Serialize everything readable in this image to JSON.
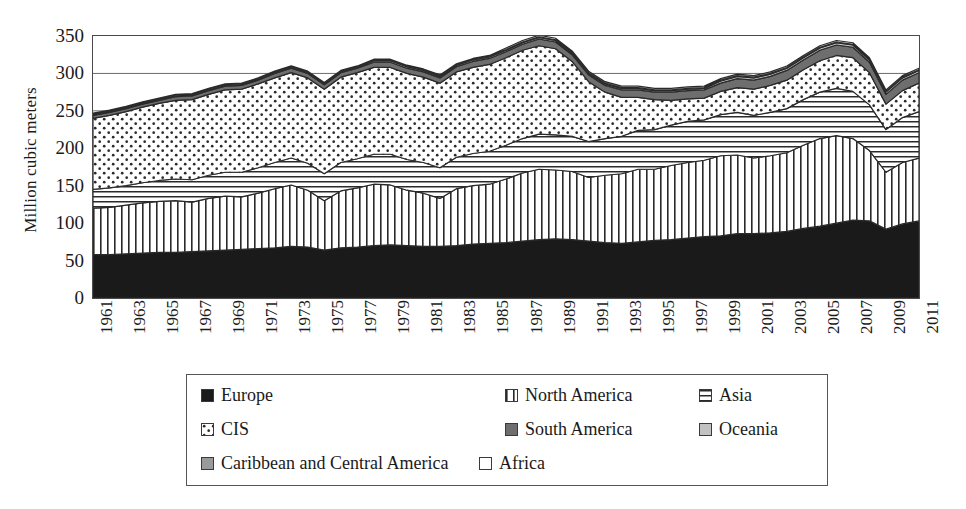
{
  "chart_data": {
    "type": "area",
    "title": "",
    "subtitle": "",
    "xlabel": "",
    "ylabel": "Million cubic meters",
    "stacked": true,
    "grid": true,
    "legend_position": "bottom",
    "ylim": [
      0,
      350
    ],
    "ytick_values": [
      0,
      50,
      100,
      150,
      200,
      250,
      300,
      350
    ],
    "ytick_labels": [
      "0",
      "50",
      "100",
      "150",
      "200",
      "250",
      "300",
      "350"
    ],
    "xlim": [
      1961,
      2011
    ],
    "x": [
      1961,
      1962,
      1963,
      1964,
      1965,
      1966,
      1967,
      1968,
      1969,
      1970,
      1971,
      1972,
      1973,
      1974,
      1975,
      1976,
      1977,
      1978,
      1979,
      1980,
      1981,
      1982,
      1983,
      1984,
      1985,
      1986,
      1987,
      1988,
      1989,
      1990,
      1991,
      1992,
      1993,
      1994,
      1995,
      1996,
      1997,
      1998,
      1999,
      2000,
      2001,
      2002,
      2003,
      2004,
      2005,
      2006,
      2007,
      2008,
      2009,
      2010,
      2011
    ],
    "xtick_labels": [
      "1961",
      "1963",
      "1965",
      "1967",
      "1969",
      "1971",
      "1973",
      "1975",
      "1977",
      "1979",
      "1981",
      "1983",
      "1985",
      "1987",
      "1989",
      "1991",
      "1993",
      "1995",
      "1997",
      "1999",
      "2001",
      "2003",
      "2005",
      "2007",
      "2009",
      "2011"
    ],
    "xtick_step": 2,
    "series": [
      {
        "name": "Europe",
        "pattern": "solid-black",
        "color": "#1a1a1a",
        "values": [
          58,
          58,
          59,
          60,
          61,
          61,
          62,
          63,
          64,
          65,
          66,
          67,
          69,
          68,
          64,
          67,
          68,
          70,
          71,
          70,
          69,
          69,
          70,
          72,
          73,
          74,
          76,
          78,
          79,
          78,
          76,
          74,
          73,
          75,
          77,
          78,
          80,
          82,
          83,
          86,
          86,
          87,
          89,
          93,
          96,
          100,
          104,
          103,
          92,
          99,
          103
        ]
      },
      {
        "name": "North America",
        "pattern": "vertical-lines",
        "color": "#ffffff",
        "values": [
          62,
          63,
          65,
          67,
          68,
          69,
          66,
          70,
          72,
          70,
          74,
          79,
          82,
          76,
          66,
          76,
          79,
          82,
          80,
          74,
          71,
          64,
          76,
          78,
          79,
          85,
          91,
          94,
          92,
          91,
          85,
          90,
          93,
          97,
          95,
          99,
          101,
          102,
          107,
          105,
          101,
          103,
          105,
          111,
          117,
          117,
          109,
          94,
          76,
          82,
          84
        ]
      },
      {
        "name": "Asia",
        "pattern": "horizontal-lines",
        "color": "#ffffff",
        "values": [
          25,
          26,
          26,
          27,
          28,
          29,
          30,
          31,
          32,
          33,
          34,
          35,
          36,
          36,
          36,
          38,
          39,
          40,
          41,
          41,
          41,
          41,
          42,
          43,
          44,
          45,
          46,
          47,
          47,
          47,
          48,
          49,
          50,
          52,
          53,
          54,
          55,
          54,
          55,
          57,
          57,
          58,
          59,
          61,
          62,
          63,
          63,
          61,
          57,
          60,
          62
        ]
      },
      {
        "name": "CIS",
        "pattern": "dots",
        "color": "#ffffff",
        "values": [
          95,
          97,
          99,
          101,
          103,
          105,
          107,
          108,
          110,
          111,
          112,
          113,
          114,
          114,
          113,
          114,
          115,
          116,
          116,
          115,
          114,
          113,
          114,
          115,
          116,
          117,
          118,
          118,
          115,
          100,
          80,
          62,
          52,
          44,
          40,
          33,
          30,
          29,
          31,
          33,
          35,
          36,
          38,
          40,
          42,
          44,
          45,
          43,
          34,
          36,
          38
        ]
      },
      {
        "name": "South America",
        "pattern": "solid-dark-gray",
        "color": "#6e6e6e",
        "values": [
          4,
          4,
          4,
          4,
          4,
          5,
          5,
          5,
          5,
          5,
          5,
          6,
          6,
          6,
          6,
          6,
          6,
          7,
          7,
          7,
          7,
          7,
          7,
          8,
          8,
          8,
          8,
          9,
          9,
          9,
          9,
          9,
          10,
          10,
          10,
          11,
          11,
          11,
          11,
          12,
          12,
          12,
          13,
          13,
          14,
          14,
          14,
          14,
          13,
          14,
          14
        ]
      },
      {
        "name": "Oceania",
        "pattern": "solid-light-gray",
        "color": "#c2c2c2",
        "values": [
          1,
          1,
          1,
          1,
          1,
          1,
          1,
          1,
          1,
          1,
          1,
          1,
          1,
          1,
          1,
          1,
          1,
          2,
          2,
          2,
          2,
          2,
          2,
          2,
          2,
          2,
          2,
          2,
          2,
          2,
          2,
          2,
          2,
          2,
          2,
          2,
          2,
          2,
          3,
          3,
          3,
          3,
          3,
          3,
          3,
          3,
          3,
          3,
          3,
          3,
          3
        ]
      },
      {
        "name": "Caribbean and Central America",
        "pattern": "solid-mid-gray",
        "color": "#9a9a9a",
        "values": [
          1,
          1,
          1,
          1,
          1,
          1,
          1,
          1,
          1,
          1,
          1,
          1,
          1,
          1,
          1,
          1,
          1,
          1,
          1,
          1,
          1,
          1,
          1,
          1,
          1,
          1,
          1,
          1,
          1,
          1,
          1,
          1,
          1,
          1,
          1,
          1,
          1,
          1,
          1,
          1,
          1,
          1,
          1,
          1,
          1,
          1,
          1,
          1,
          1,
          1,
          1
        ]
      },
      {
        "name": "Africa",
        "pattern": "empty-white",
        "color": "#ffffff",
        "values": [
          1,
          1,
          1,
          1,
          1,
          1,
          1,
          1,
          1,
          1,
          1,
          1,
          1,
          1,
          1,
          1,
          1,
          1,
          1,
          1,
          1,
          1,
          1,
          1,
          1,
          2,
          2,
          2,
          2,
          2,
          2,
          2,
          2,
          2,
          2,
          2,
          2,
          2,
          2,
          2,
          2,
          2,
          2,
          2,
          2,
          2,
          2,
          2,
          2,
          2,
          2
        ]
      }
    ]
  },
  "legend": {
    "rows": [
      [
        {
          "label": "Europe",
          "pattern": "solid-black",
          "x": 14
        },
        {
          "label": "North America",
          "pattern": "vertical-lines",
          "x": 318
        },
        {
          "label": "Asia",
          "pattern": "horizontal-lines",
          "x": 512
        }
      ],
      [
        {
          "label": "CIS",
          "pattern": "dots",
          "x": 14
        },
        {
          "label": "South America",
          "pattern": "solid-dark-gray",
          "x": 318
        },
        {
          "label": "Oceania",
          "pattern": "solid-light-gray",
          "x": 512
        }
      ],
      [
        {
          "label": "Caribbean and Central America",
          "pattern": "solid-mid-gray",
          "x": 14
        },
        {
          "label": "Africa",
          "pattern": "empty-white",
          "x": 292
        }
      ]
    ]
  },
  "axis": {
    "y_title": "Million cubic meters"
  },
  "colors": {
    "frame": "#4a4a4a",
    "gridline": "#6b6b6b",
    "europe": "#1a1a1a",
    "south_america": "#6e6e6e",
    "oceania": "#c2c2c2",
    "caribbean": "#9a9a9a",
    "africa": "#ffffff",
    "outline": "#2a2a2a"
  }
}
